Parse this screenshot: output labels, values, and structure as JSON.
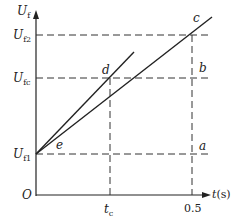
{
  "figure": {
    "y_axis_label": "U",
    "y_axis_sub": "f",
    "x_axis_label": "t",
    "x_axis_unit": "(s)",
    "origin_label": "O",
    "y_ticks": [
      {
        "main": "U",
        "sub": "f2"
      },
      {
        "main": "U",
        "sub": "fc"
      },
      {
        "main": "U",
        "sub": "f1"
      }
    ],
    "x_ticks": [
      {
        "main": "t",
        "sub": "c"
      },
      {
        "main": "0.5",
        "sub": ""
      }
    ],
    "points": {
      "a": "a",
      "b": "b",
      "c": "c",
      "d": "d",
      "e": "e"
    },
    "line_color": "#222222",
    "dash_color": "#333333"
  }
}
